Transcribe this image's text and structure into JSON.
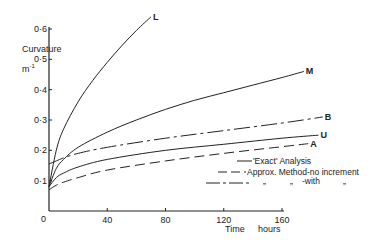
{
  "chart_data": {
    "type": "line",
    "title": "",
    "ylabel": "Curvature",
    "ylabel_unit": "m-1",
    "xlabel": "Time",
    "xlabel_unit": "hours",
    "xlim": [
      0,
      160
    ],
    "ylim": [
      0,
      0.6
    ],
    "x_ticks": [
      "40",
      "80",
      "120",
      "160"
    ],
    "x_tick_values": [
      40,
      80,
      120,
      160
    ],
    "y_ticks": [
      "0·1",
      "0·2",
      "0·3",
      "0·4",
      "0·5",
      "0·6"
    ],
    "y_tick_values": [
      0.1,
      0.2,
      0.3,
      0.4,
      0.5,
      0.6
    ],
    "origin_label": "0",
    "grid": false,
    "legend_position": "bottom-right",
    "legend": [
      {
        "style": "solid",
        "text": "'Exact' Analysis"
      },
      {
        "style": "dashed",
        "text": "Approx. Method-no increment"
      },
      {
        "style": "dashdot",
        "text_parts": [
          "„",
          "„",
          "-with",
          "„"
        ]
      }
    ],
    "series": [
      {
        "name": "L",
        "style": "solid",
        "x": [
          0,
          5,
          10,
          20,
          30,
          40,
          50,
          60,
          70
        ],
        "y": [
          0.08,
          0.2,
          0.27,
          0.36,
          0.43,
          0.49,
          0.545,
          0.595,
          0.64
        ]
      },
      {
        "name": "M",
        "style": "solid",
        "x": [
          0,
          5,
          10,
          20,
          40,
          60,
          80,
          100,
          120,
          140,
          160,
          175
        ],
        "y": [
          0.08,
          0.14,
          0.17,
          0.21,
          0.26,
          0.3,
          0.335,
          0.365,
          0.39,
          0.415,
          0.44,
          0.46
        ]
      },
      {
        "name": "B",
        "style": "dashdot",
        "x": [
          0,
          5,
          10,
          20,
          40,
          80,
          120,
          160,
          188
        ],
        "y": [
          0.155,
          0.165,
          0.175,
          0.19,
          0.21,
          0.24,
          0.265,
          0.29,
          0.31
        ]
      },
      {
        "name": "U",
        "style": "solid",
        "x": [
          0,
          5,
          10,
          20,
          40,
          80,
          120,
          160,
          185
        ],
        "y": [
          0.08,
          0.11,
          0.125,
          0.145,
          0.17,
          0.2,
          0.22,
          0.24,
          0.25
        ]
      },
      {
        "name": "A",
        "style": "dashed",
        "x": [
          0,
          5,
          10,
          20,
          40,
          80,
          120,
          160,
          178
        ],
        "y": [
          0.07,
          0.085,
          0.095,
          0.11,
          0.135,
          0.165,
          0.19,
          0.212,
          0.222
        ]
      }
    ]
  }
}
